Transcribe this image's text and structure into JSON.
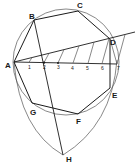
{
  "figure": {
    "vertices": {
      "A": "A",
      "B": "B",
      "C": "C",
      "D": "D",
      "E": "E",
      "F": "F",
      "G": "G",
      "H": "H"
    },
    "divisions": [
      "1",
      "2",
      "3",
      "4",
      "5",
      "6",
      "7"
    ],
    "colors": {
      "ink": "#1a1a1a",
      "paper": "#ffffff"
    }
  }
}
